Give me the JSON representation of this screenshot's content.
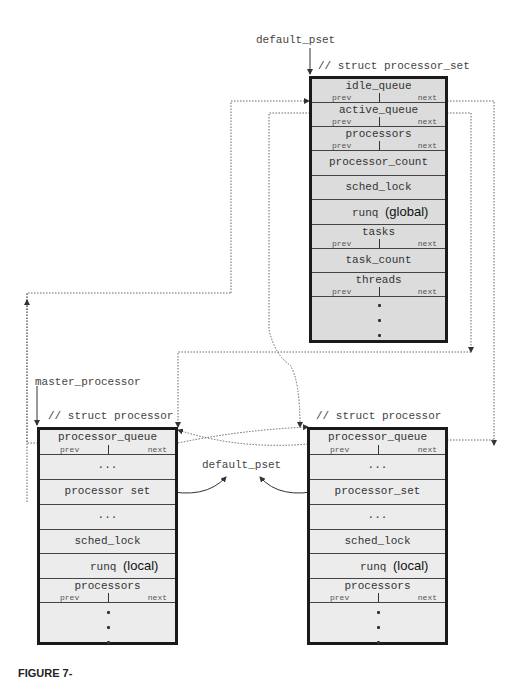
{
  "labels": {
    "default_pset_top": "default_pset",
    "processor_set_comment": "// struct processor_set",
    "master_processor": "master_processor",
    "left_comment": "// struct processor",
    "right_comment": "// struct processor",
    "default_pset_middle": "default_pset"
  },
  "processor_set": {
    "rows": [
      {
        "name": "idle_queue",
        "prev": "prev",
        "next": "next"
      },
      {
        "name": "active_queue",
        "prev": "prev",
        "next": "next"
      },
      {
        "name": "processors",
        "prev": "prev",
        "next": "next"
      },
      {
        "name": "processor_count"
      },
      {
        "name": "sched_lock"
      },
      {
        "name": "runq",
        "scope": "(global)"
      },
      {
        "name": "tasks",
        "prev": "prev",
        "next": "next"
      },
      {
        "name": "task_count"
      },
      {
        "name": "threads",
        "prev": "prev",
        "next": "next"
      }
    ],
    "ellipsis": "⋮"
  },
  "master_processor_struct": {
    "rows": [
      {
        "name": "processor_queue",
        "prev": "prev",
        "next": "next"
      },
      {
        "name": "..."
      },
      {
        "name": "processor set"
      },
      {
        "name": "..."
      },
      {
        "name": "sched_lock"
      },
      {
        "name": "runq",
        "scope": "(local)"
      },
      {
        "name": "processors",
        "prev": "prev",
        "next": "next"
      }
    ]
  },
  "other_processor_struct": {
    "rows": [
      {
        "name": "processor_queue",
        "prev": "prev",
        "next": "next"
      },
      {
        "name": "..."
      },
      {
        "name": "processor_set"
      },
      {
        "name": "..."
      },
      {
        "name": "sched_lock"
      },
      {
        "name": "runq",
        "scope": "(local)"
      },
      {
        "name": "processors",
        "prev": "prev",
        "next": "next"
      }
    ]
  },
  "caption": "FIGURE 7-"
}
